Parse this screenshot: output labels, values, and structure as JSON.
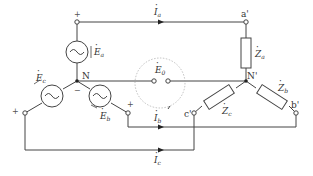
{
  "diagram": {
    "type": "three-phase Y-Y circuit with neutral displacement voltage",
    "nodes": {
      "source_neutral": "N",
      "load_neutral": "N'",
      "load_a": "a'",
      "load_b": "b'",
      "load_c": "c'"
    },
    "sources": [
      {
        "name": "E",
        "sub": "a"
      },
      {
        "name": "E",
        "sub": "b"
      },
      {
        "name": "E",
        "sub": "c"
      }
    ],
    "currents": [
      {
        "name": "I",
        "sub": "a"
      },
      {
        "name": "I",
        "sub": "b"
      },
      {
        "name": "I",
        "sub": "c"
      }
    ],
    "impedances": [
      {
        "name": "Z",
        "sub": "a"
      },
      {
        "name": "Z",
        "sub": "b"
      },
      {
        "name": "Z",
        "sub": "c"
      }
    ],
    "neutral_voltage": {
      "name": "E",
      "sub": "0"
    },
    "polarity": {
      "plus": "+",
      "minus": "−"
    },
    "line_color": "#444444"
  }
}
